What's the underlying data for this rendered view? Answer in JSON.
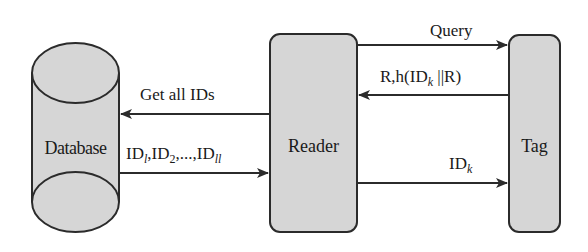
{
  "nodes": {
    "database": {
      "label": "Database",
      "shape": "cylinder"
    },
    "reader": {
      "label": "Reader",
      "shape": "rounded-rectangle"
    },
    "tag": {
      "label": "Tag",
      "shape": "rounded-rectangle"
    }
  },
  "edges": [
    {
      "id": "get-all-ids",
      "from": "Reader",
      "to": "Database",
      "label": "Get all IDs"
    },
    {
      "id": "id-list",
      "from": "Database",
      "to": "Reader",
      "label_parts": {
        "p1": "ID",
        "s1": "l",
        "p2": ",ID",
        "s2": "2",
        "p3": ",...,ID",
        "s3": "ll"
      }
    },
    {
      "id": "query",
      "from": "Reader",
      "to": "Tag",
      "label": "Query"
    },
    {
      "id": "response",
      "from": "Tag",
      "to": "Reader",
      "label_parts": {
        "p1": "R,h(ID",
        "s1": "k",
        "p2": " ||R)"
      }
    },
    {
      "id": "id-k",
      "from": "Reader",
      "to": "Tag",
      "label_parts": {
        "p1": "ID",
        "s1": "k"
      }
    }
  ],
  "colors": {
    "fill": "#d6d6d6",
    "stroke": "#2b2b2b",
    "background": "#ffffff"
  }
}
